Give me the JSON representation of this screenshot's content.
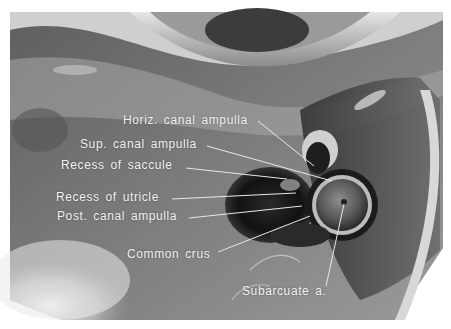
{
  "figure": {
    "colors": {
      "background": "#ffffff",
      "label_text": "#f2f2f2",
      "leader_line": "#e8e8e8"
    },
    "labels": [
      {
        "id": "horiz-canal-ampulla",
        "text": "Horiz. canal ampulla"
      },
      {
        "id": "sup-canal-ampulla",
        "text": "Sup. canal ampulla"
      },
      {
        "id": "recess-of-saccule",
        "text": "Recess of saccule"
      },
      {
        "id": "recess-of-utricle",
        "text": "Recess of utricle"
      },
      {
        "id": "post-canal-ampulla",
        "text": "Post. canal ampulla"
      },
      {
        "id": "common-crus",
        "text": "Common crus"
      },
      {
        "id": "subarcuate-a",
        "text": "Subarcuate a."
      }
    ]
  }
}
